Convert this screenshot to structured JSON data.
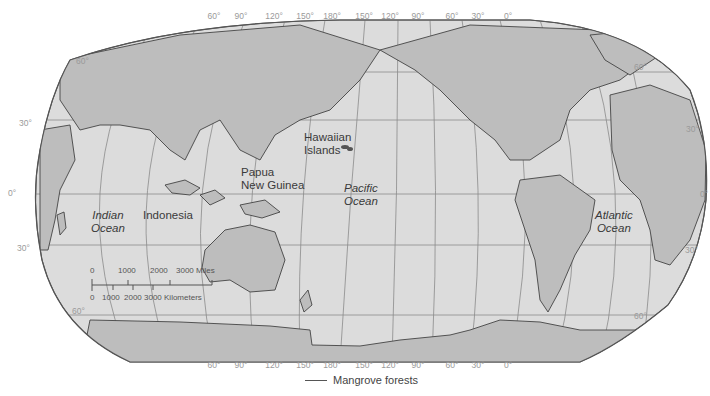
{
  "map": {
    "title": "Mangrove forests world map",
    "colors": {
      "ocean": "#dcdcdc",
      "land": "#bdbdbd",
      "border": "#555555",
      "graticule": "#8a8a8a",
      "label": "#3a3a3a",
      "degree_label": "#9a9a9a"
    },
    "longitude_labels_top": [
      "60°",
      "90°",
      "120°",
      "150°",
      "180°",
      "150°",
      "120°",
      "90°",
      "60°",
      "30°",
      "0°"
    ],
    "longitude_labels_bottom": [
      "60°",
      "90°",
      "120°",
      "150°",
      "180°",
      "150°",
      "120°",
      "90°",
      "60°",
      "30°",
      "0°"
    ],
    "latitude_labels_left": [
      "60°",
      "30°",
      "0°",
      "30°",
      "60°"
    ],
    "latitude_labels_right": [
      "60°",
      "30°",
      "0°",
      "30°",
      "60°"
    ],
    "place_labels": {
      "hawaiian_1": "Hawaiian",
      "hawaiian_2": "Islands",
      "papua_1": "Papua",
      "papua_2": "New Guinea",
      "pacific_1": "Pacific",
      "pacific_2": "Ocean",
      "indian_1": "Indian",
      "indian_2": "Ocean",
      "indonesia": "Indonesia",
      "atlantic_1": "Atlantic",
      "atlantic_2": "Ocean"
    },
    "scale_bar": {
      "miles_ticks": [
        "0",
        "1000",
        "2000",
        "3000 Miles"
      ],
      "km_ticks": [
        "0",
        "1000",
        "2000",
        "3000 Kilometers"
      ]
    },
    "legend": {
      "label": "Mangrove forests"
    }
  }
}
